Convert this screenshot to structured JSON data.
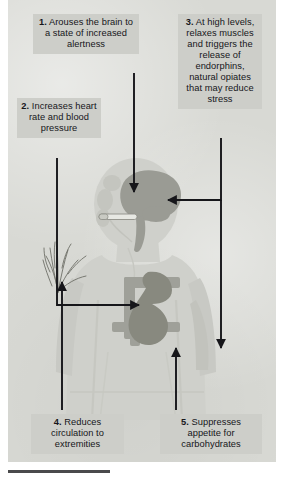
{
  "figure": {
    "background_color": "#d8d9d4",
    "callout_bg_color": "#cdcec9",
    "ink_color": "#16161a",
    "body_color": "#cfd0cb",
    "organ_color": "#9a9b94",
    "organ_dark_color": "#88897f"
  },
  "callouts": [
    {
      "id": "callout-1",
      "number": "1.",
      "text": "Arouses the brain to a state of increased alertness",
      "full": "1. Arouses the brain to a state of increased alertness",
      "target": "brain"
    },
    {
      "id": "callout-2",
      "number": "2.",
      "text": "Increases heart rate and blood pressure",
      "full": "2. Increases heart rate and blood pressure",
      "target": "heart"
    },
    {
      "id": "callout-3",
      "number": "3.",
      "text": "At high levels, relaxes muscles and triggers the release of endorphins, natural opiates that may reduce stress",
      "full": "3. At high levels, relaxes muscles and triggers the release of endorphins, natural opiates that may reduce stress",
      "target": "brain-and-muscles"
    },
    {
      "id": "callout-4",
      "number": "4.",
      "text": "Reduces circulation to extremities",
      "full": "4. Reduces circulation to extremities",
      "target": "hand"
    },
    {
      "id": "callout-5",
      "number": "5.",
      "text": "Suppresses appetite for carbohydrates",
      "full": "5. Suppresses appetite for carbohydrates",
      "target": "abdomen"
    }
  ],
  "anatomy": [
    {
      "name": "human-body-silhouette",
      "label": "human body silhouette"
    },
    {
      "name": "brain-organ",
      "label": "brain"
    },
    {
      "name": "heart-organ",
      "label": "heart"
    },
    {
      "name": "rib-sternum-shape",
      "label": "ribs and sternum"
    },
    {
      "name": "hand-nerves-sketch",
      "label": "hand with nerves / extremities"
    },
    {
      "name": "cigarette-shape",
      "label": "cigarette at mouth"
    }
  ],
  "arrows": [
    {
      "name": "arrow-callout-1-to-brain",
      "direction": "down"
    },
    {
      "name": "arrow-callout-2-to-heart",
      "direction": "down-then-right"
    },
    {
      "name": "arrow-callout-3-to-brain",
      "direction": "down-then-left"
    },
    {
      "name": "arrow-callout-3-to-muscles",
      "direction": "down"
    },
    {
      "name": "arrow-callout-4-to-hand",
      "direction": "up"
    },
    {
      "name": "arrow-callout-5-to-abdomen",
      "direction": "up"
    }
  ]
}
